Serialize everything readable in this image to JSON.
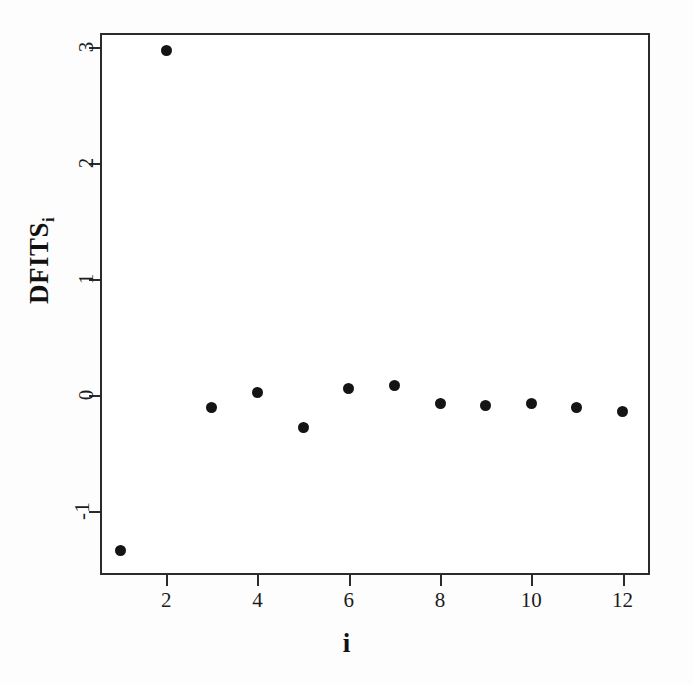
{
  "figure": {
    "width": 693,
    "height": 684,
    "background_color": "#fdfdfd",
    "plot_background_color": "#ffffff",
    "frame_color": "#2b2b2b",
    "point_color": "#141414"
  },
  "chart_data": {
    "type": "scatter",
    "title": "",
    "xlabel": "i",
    "ylabel": "DFITS",
    "ylabel_subscript": "i",
    "x": [
      1,
      2,
      3,
      4,
      5,
      6,
      7,
      8,
      9,
      10,
      11,
      12
    ],
    "values": [
      -1.34,
      2.97,
      -0.11,
      0.02,
      -0.28,
      0.06,
      0.08,
      -0.07,
      -0.09,
      -0.07,
      -0.11,
      -0.14
    ],
    "series": [
      {
        "name": "DFITS",
        "values": [
          -1.34,
          2.97,
          -0.11,
          0.02,
          -0.28,
          0.06,
          0.08,
          -0.07,
          -0.09,
          -0.07,
          -0.11,
          -0.14
        ]
      }
    ],
    "xticks": [
      2,
      4,
      6,
      8,
      10,
      12
    ],
    "xtick_labels": [
      "2",
      "4",
      "6",
      "8",
      "10",
      "12"
    ],
    "yticks": [
      -1,
      0,
      1,
      2,
      3
    ],
    "ytick_labels": [
      "-1",
      "0",
      "1",
      "2",
      "3"
    ],
    "xlim": [
      0.55,
      12.6
    ],
    "ylim": [
      -1.55,
      3.12
    ],
    "grid": false,
    "legend": null,
    "marker": "filled-circle",
    "annotations": []
  }
}
